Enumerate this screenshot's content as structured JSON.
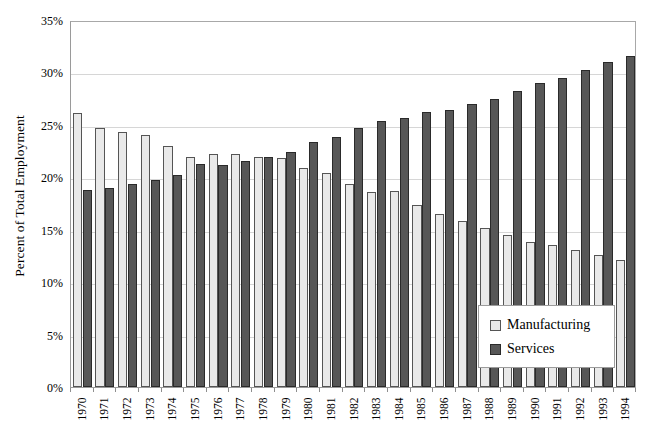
{
  "chart_data": {
    "type": "bar",
    "title": "",
    "xlabel": "",
    "ylabel": "Percent of Total Employment",
    "ylim": [
      0,
      35
    ],
    "ytick_labels": [
      "0%",
      "5%",
      "10%",
      "15%",
      "20%",
      "25%",
      "30%",
      "35%"
    ],
    "ytick_values": [
      0,
      5,
      10,
      15,
      20,
      25,
      30,
      35
    ],
    "grid": true,
    "legend_position": "lower-right-inside",
    "categories": [
      "1970",
      "1971",
      "1972",
      "1973",
      "1974",
      "1975",
      "1976",
      "1977",
      "1978",
      "1979",
      "1980",
      "1981",
      "1982",
      "1983",
      "1984",
      "1985",
      "1986",
      "1987",
      "1988",
      "1989",
      "1990",
      "1991",
      "1992",
      "1993",
      "1994"
    ],
    "series": [
      {
        "name": "Manufacturing",
        "color": "#e9e9e9",
        "values": [
          26.1,
          24.7,
          24.3,
          24.0,
          23.0,
          21.9,
          22.2,
          22.2,
          21.9,
          21.8,
          20.9,
          20.4,
          19.4,
          18.6,
          18.7,
          17.4,
          16.5,
          15.8,
          15.2,
          14.5,
          13.8,
          13.5,
          13.1,
          12.6,
          12.1
        ]
      },
      {
        "name": "Services",
        "color": "#575757",
        "values": [
          18.8,
          19.0,
          19.4,
          19.7,
          20.2,
          21.3,
          21.2,
          21.6,
          21.9,
          22.4,
          23.4,
          23.8,
          24.7,
          25.4,
          25.7,
          26.2,
          26.4,
          27.0,
          27.5,
          28.2,
          29.0,
          29.5,
          30.2,
          31.0,
          31.6
        ]
      }
    ]
  },
  "legend": {
    "items": [
      {
        "label": "Manufacturing"
      },
      {
        "label": "Services"
      }
    ]
  },
  "caption": ""
}
